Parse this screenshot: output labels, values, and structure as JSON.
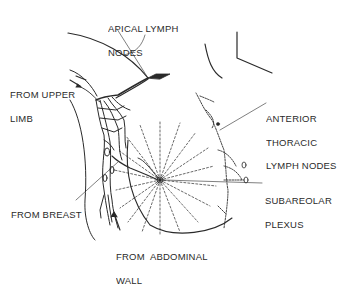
{
  "diagram": {
    "colors": {
      "ink": "#2a2a2a",
      "background": "#ffffff"
    },
    "labels": {
      "apical": {
        "line1": "APICAL LYMPH",
        "line2": "NODES"
      },
      "upper_limb": {
        "line1": "FROM UPPER",
        "line2": "LIMB"
      },
      "anterior_thoracic": {
        "line1": "ANTERIOR",
        "line2": "THORACIC",
        "line3": "LYMPH NODES"
      },
      "breast": {
        "line1": "FROM BREAST"
      },
      "subareolar": {
        "line1": "SUBAREOLAR",
        "line2": "PLEXUS"
      },
      "abdominal_wall": {
        "line1": "FROM  ABDOMINAL",
        "line2": "WALL"
      }
    }
  }
}
